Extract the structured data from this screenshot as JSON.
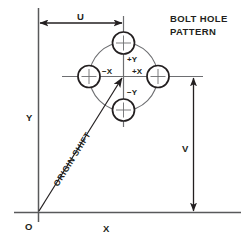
{
  "diagram": {
    "title_line1": "BOLT HOLE",
    "title_line2": "PATTERN",
    "axes": {
      "origin_label": "O",
      "x_axis_label": "X",
      "y_axis_label": "Y"
    },
    "dimensions": {
      "u_label": "U",
      "v_label": "V"
    },
    "origin_shift": {
      "label": "ORIGIN SHIFT"
    },
    "quadrants": {
      "plus_y": "+Y",
      "minus_y": "−Y",
      "plus_x": "+X",
      "minus_x": "−X"
    },
    "colors": {
      "line": "#231f20",
      "thin_line": "#6d6e71",
      "background": "#ffffff"
    }
  }
}
